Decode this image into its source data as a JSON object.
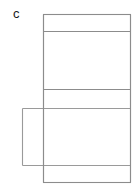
{
  "figure": {
    "panel_label": "c",
    "caption": "",
    "background_color": "#ffffff",
    "stroke_color": "#8c8c8c",
    "fill_color": "#ffffff",
    "width": 139,
    "height": 193
  },
  "chart_data": {
    "type": "diagram",
    "title": "",
    "units": "pixels",
    "shapes": [
      {
        "name": "face-top",
        "role": "top-flap",
        "x": 43,
        "y": 14,
        "width": 88,
        "height": 17,
        "stroke": "#8c8c8c",
        "fill": "#ffffff"
      },
      {
        "name": "face-upper-large",
        "role": "front-face",
        "x": 43,
        "y": 31,
        "width": 88,
        "height": 58,
        "stroke": "#8c8c8c",
        "fill": "#ffffff"
      },
      {
        "name": "face-middle",
        "role": "middle-face",
        "x": 43,
        "y": 89,
        "width": 88,
        "height": 76,
        "stroke": "#8c8c8c",
        "fill": "#ffffff"
      },
      {
        "name": "face-bottom",
        "role": "bottom-flap",
        "x": 43,
        "y": 165,
        "width": 88,
        "height": 18,
        "stroke": "#8c8c8c",
        "fill": "#ffffff"
      },
      {
        "name": "side-flap-overlay",
        "role": "left-side-flap",
        "x": 22,
        "y": 108,
        "width": 109,
        "height": 57,
        "stroke": "#8c8c8c",
        "fill": "none"
      }
    ],
    "guide_lines": [
      {
        "name": "divider-1",
        "x1": 43,
        "y1": 31,
        "x2": 131,
        "y2": 31
      },
      {
        "name": "divider-2",
        "x1": 43,
        "y1": 89,
        "x2": 131,
        "y2": 89
      },
      {
        "name": "divider-3",
        "x1": 43,
        "y1": 108,
        "x2": 131,
        "y2": 108
      },
      {
        "name": "divider-4",
        "x1": 43,
        "y1": 165,
        "x2": 131,
        "y2": 165
      }
    ],
    "annotations": [
      {
        "name": "panel-letter",
        "text": "c",
        "x": 15,
        "y": 18
      }
    ]
  }
}
